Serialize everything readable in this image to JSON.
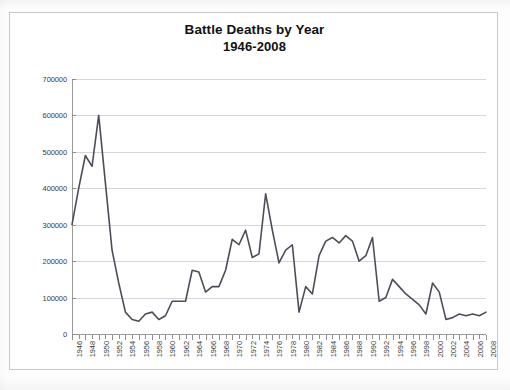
{
  "chart_data": {
    "type": "line",
    "title": "Battle Deaths by Year",
    "subtitle": "1946-2008",
    "xlabel": "",
    "ylabel": "",
    "ylim": [
      0,
      700000
    ],
    "ytick_step": 100000,
    "ytick_labels": [
      "0",
      "100000",
      "200000",
      "300000",
      "400000",
      "500000",
      "600000",
      "700000"
    ],
    "xlim": [
      1946,
      2008
    ],
    "xtick_labels": [
      "1946",
      "1948",
      "1950",
      "1952",
      "1954",
      "1956",
      "1958",
      "1960",
      "1962",
      "1964",
      "1966",
      "1968",
      "1970",
      "1972",
      "1974",
      "1976",
      "1978",
      "1980",
      "1982",
      "1984",
      "1986",
      "1988",
      "1990",
      "1992",
      "1994",
      "1996",
      "1998",
      "2000",
      "2002",
      "2004",
      "2006",
      "2008"
    ],
    "grid": true,
    "legend": "none",
    "line_color": "#4d4d59",
    "x": [
      1946,
      1947,
      1948,
      1949,
      1950,
      1951,
      1952,
      1953,
      1954,
      1955,
      1956,
      1957,
      1958,
      1959,
      1960,
      1961,
      1962,
      1963,
      1964,
      1965,
      1966,
      1967,
      1968,
      1969,
      1970,
      1971,
      1972,
      1973,
      1974,
      1975,
      1976,
      1977,
      1978,
      1979,
      1980,
      1981,
      1982,
      1983,
      1984,
      1985,
      1986,
      1987,
      1988,
      1989,
      1990,
      1991,
      1992,
      1993,
      1994,
      1995,
      1996,
      1997,
      1998,
      1999,
      2000,
      2001,
      2002,
      2003,
      2004,
      2005,
      2006,
      2007,
      2008
    ],
    "values": [
      300000,
      400000,
      490000,
      460000,
      600000,
      415000,
      230000,
      140000,
      60000,
      40000,
      35000,
      55000,
      60000,
      40000,
      50000,
      90000,
      90000,
      90000,
      175000,
      170000,
      115000,
      130000,
      130000,
      175000,
      260000,
      245000,
      285000,
      210000,
      220000,
      385000,
      285000,
      195000,
      230000,
      245000,
      60000,
      130000,
      110000,
      215000,
      255000,
      265000,
      250000,
      270000,
      255000,
      200000,
      215000,
      265000,
      90000,
      100000,
      150000,
      130000,
      110000,
      95000,
      80000,
      55000,
      140000,
      115000,
      40000,
      45000,
      55000,
      50000,
      55000,
      50000,
      60000
    ]
  }
}
